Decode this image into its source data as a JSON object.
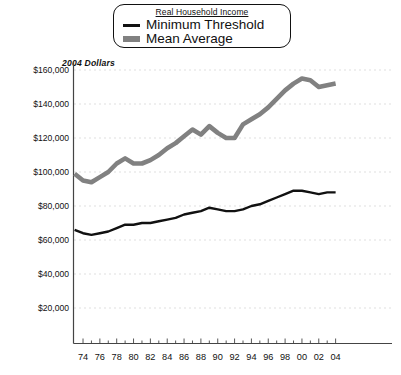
{
  "legend": {
    "title": "Real Household Income",
    "entries": [
      {
        "label": "Minimum Threshold",
        "swatch": "thin-black-line",
        "color": "#111111"
      },
      {
        "label": "Mean Average",
        "swatch": "thick-gray-line",
        "color": "#818181"
      }
    ]
  },
  "axis_note": "2004 Dollars",
  "chart_data": {
    "type": "line",
    "title": "Real Household Income",
    "xlabel": "",
    "ylabel": "2004 Dollars",
    "ylim": [
      0,
      160000
    ],
    "xlim": [
      1973,
      2004
    ],
    "grid": true,
    "legend_position": "top-center",
    "ytick_labels": [
      "$160,000",
      "$140,000",
      "$120,000",
      "$100,000",
      "$80,000",
      "$60,000",
      "$40,000",
      "$20,000"
    ],
    "ytick_values": [
      160000,
      140000,
      120000,
      100000,
      80000,
      60000,
      40000,
      20000
    ],
    "xtick_labels": [
      "74",
      "76",
      "78",
      "80",
      "82",
      "84",
      "86",
      "88",
      "90",
      "92",
      "94",
      "96",
      "98",
      "00",
      "02",
      "04"
    ],
    "xtick_values": [
      1974,
      1976,
      1978,
      1980,
      1982,
      1984,
      1986,
      1988,
      1990,
      1992,
      1994,
      1996,
      1998,
      2000,
      2002,
      2004
    ],
    "x": [
      1973,
      1974,
      1975,
      1976,
      1977,
      1978,
      1979,
      1980,
      1981,
      1982,
      1983,
      1984,
      1985,
      1986,
      1987,
      1988,
      1989,
      1990,
      1991,
      1992,
      1993,
      1994,
      1995,
      1996,
      1997,
      1998,
      1999,
      2000,
      2001,
      2002,
      2003,
      2004
    ],
    "series": [
      {
        "name": "Mean Average",
        "color": "#818181",
        "values": [
          99000,
          95000,
          94000,
          97000,
          100000,
          105000,
          108000,
          105000,
          105000,
          107000,
          110000,
          114000,
          117000,
          121000,
          125000,
          122000,
          127000,
          123000,
          120000,
          120000,
          128000,
          131000,
          134000,
          138000,
          143000,
          148000,
          152000,
          155000,
          154000,
          150000,
          151000,
          152000
        ]
      },
      {
        "name": "Minimum Threshold",
        "color": "#111111",
        "values": [
          66000,
          64000,
          63000,
          64000,
          65000,
          67000,
          69000,
          69000,
          70000,
          70000,
          71000,
          72000,
          73000,
          75000,
          76000,
          77000,
          79000,
          78000,
          77000,
          77000,
          78000,
          80000,
          81000,
          83000,
          85000,
          87000,
          89000,
          89000,
          88000,
          87000,
          88000,
          88000
        ]
      }
    ]
  }
}
